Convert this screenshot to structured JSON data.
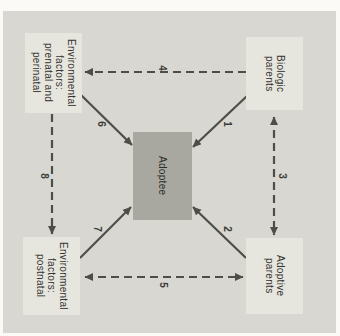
{
  "figure": {
    "colors": {
      "page_background": "#fbfaf6",
      "panel_background": "#d8d7d1",
      "outer_box_fill": "#e7e6de",
      "adoptee_box_fill": "#a9a8a0",
      "arrow_and_text": "#4d4d49"
    },
    "boxes": {
      "prenatal": {
        "label": "Environmental\nfactors:\nprenatal and\nperinatal"
      },
      "biologic": {
        "label": "Biologic\nparents"
      },
      "adoptee": {
        "label": "Adoptee"
      },
      "postnatal": {
        "label": "Environmental\nfactors:\npostnatal"
      },
      "adoptive": {
        "label": "Adoptive\nparents"
      }
    },
    "arrows": [
      {
        "label": "1",
        "from": "biologic-parents",
        "to": "adoptee",
        "style": "solid",
        "direction": "one-way"
      },
      {
        "label": "2",
        "from": "adoptive-parents",
        "to": "adoptee",
        "style": "solid",
        "direction": "one-way"
      },
      {
        "label": "3",
        "from": "biologic-parents",
        "to": "adoptive-parents",
        "style": "dashed",
        "direction": "two-way"
      },
      {
        "label": "4",
        "from": "biologic-parents",
        "to": "environmental-prenatal",
        "style": "dashed",
        "direction": "one-way"
      },
      {
        "label": "5",
        "from": "environmental-postnatal",
        "to": "adoptive-parents",
        "style": "dashed",
        "direction": "two-way"
      },
      {
        "label": "6",
        "from": "environmental-prenatal",
        "to": "adoptee",
        "style": "solid",
        "direction": "one-way"
      },
      {
        "label": "7",
        "from": "environmental-postnatal",
        "to": "adoptee",
        "style": "solid",
        "direction": "one-way"
      },
      {
        "label": "8",
        "from": "environmental-prenatal",
        "to": "environmental-postnatal",
        "style": "dashed",
        "direction": "one-way"
      }
    ]
  }
}
